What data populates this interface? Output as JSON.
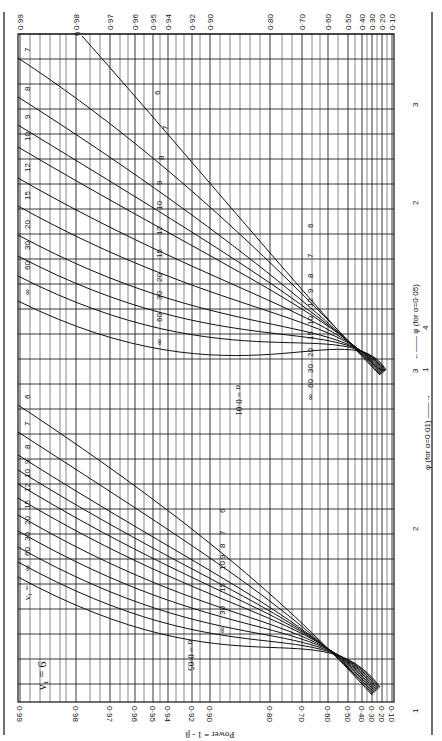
{
  "chart_data": {
    "type": "line",
    "orientation": "rotated 90 degrees clockwise",
    "nu1_label": "ν₁ = 6",
    "ylabel": "Power = 1 - β",
    "xlabel_alpha_005": "φ (for α=0·05)",
    "xlabel_alpha_001": "φ (for α=0·01)",
    "power_ticks": [
      "0·99",
      "0·98",
      "0·97",
      "0·96",
      "0·95",
      "0·94",
      "0·92",
      "0·90",
      "0·80",
      "0·70",
      "0·60",
      "0·50",
      "0·40",
      "0·30",
      "0·20",
      "0·10"
    ],
    "phi_ticks_alpha_005": [
      "1",
      "2",
      "3"
    ],
    "phi_ticks_alpha_001": [
      "1",
      "2",
      "3",
      "4"
    ],
    "nu2_values": [
      "6",
      "7",
      "8",
      "9",
      "10",
      "12",
      "15",
      "20",
      "30",
      "60",
      "∞"
    ],
    "series": [
      {
        "name": "α=0·05",
        "nu2_labels": [
          "6",
          "7",
          "8",
          "9",
          "10",
          "12",
          "15",
          "20",
          "30",
          "60",
          "∞"
        ],
        "curve_labels": [
          "6",
          "7",
          "8",
          "10 9",
          "15",
          "30",
          "∞"
        ]
      },
      {
        "name": "α=0·01",
        "nu2_labels": [
          "6",
          "7",
          "8",
          "9",
          "10",
          "12",
          "15",
          "20",
          "30",
          "60",
          "∞"
        ],
        "curve_labels": [
          "6",
          "7",
          "8",
          "9",
          "12",
          "10",
          "15",
          "20",
          "30",
          "60",
          "∞"
        ]
      }
    ],
    "grid": true
  },
  "labels": {
    "nu1": "ν₁ = 6",
    "nu1_inline": "ν₁ =",
    "power_axis": "Power = 1 - β",
    "alpha005": "α = 0·05",
    "alpha001": "α = 0·01",
    "phi005": "φ (for α=0·05)",
    "phi001": "φ (for α=0·01)",
    "arrow_left": "←——",
    "arrow_right": "——→"
  }
}
